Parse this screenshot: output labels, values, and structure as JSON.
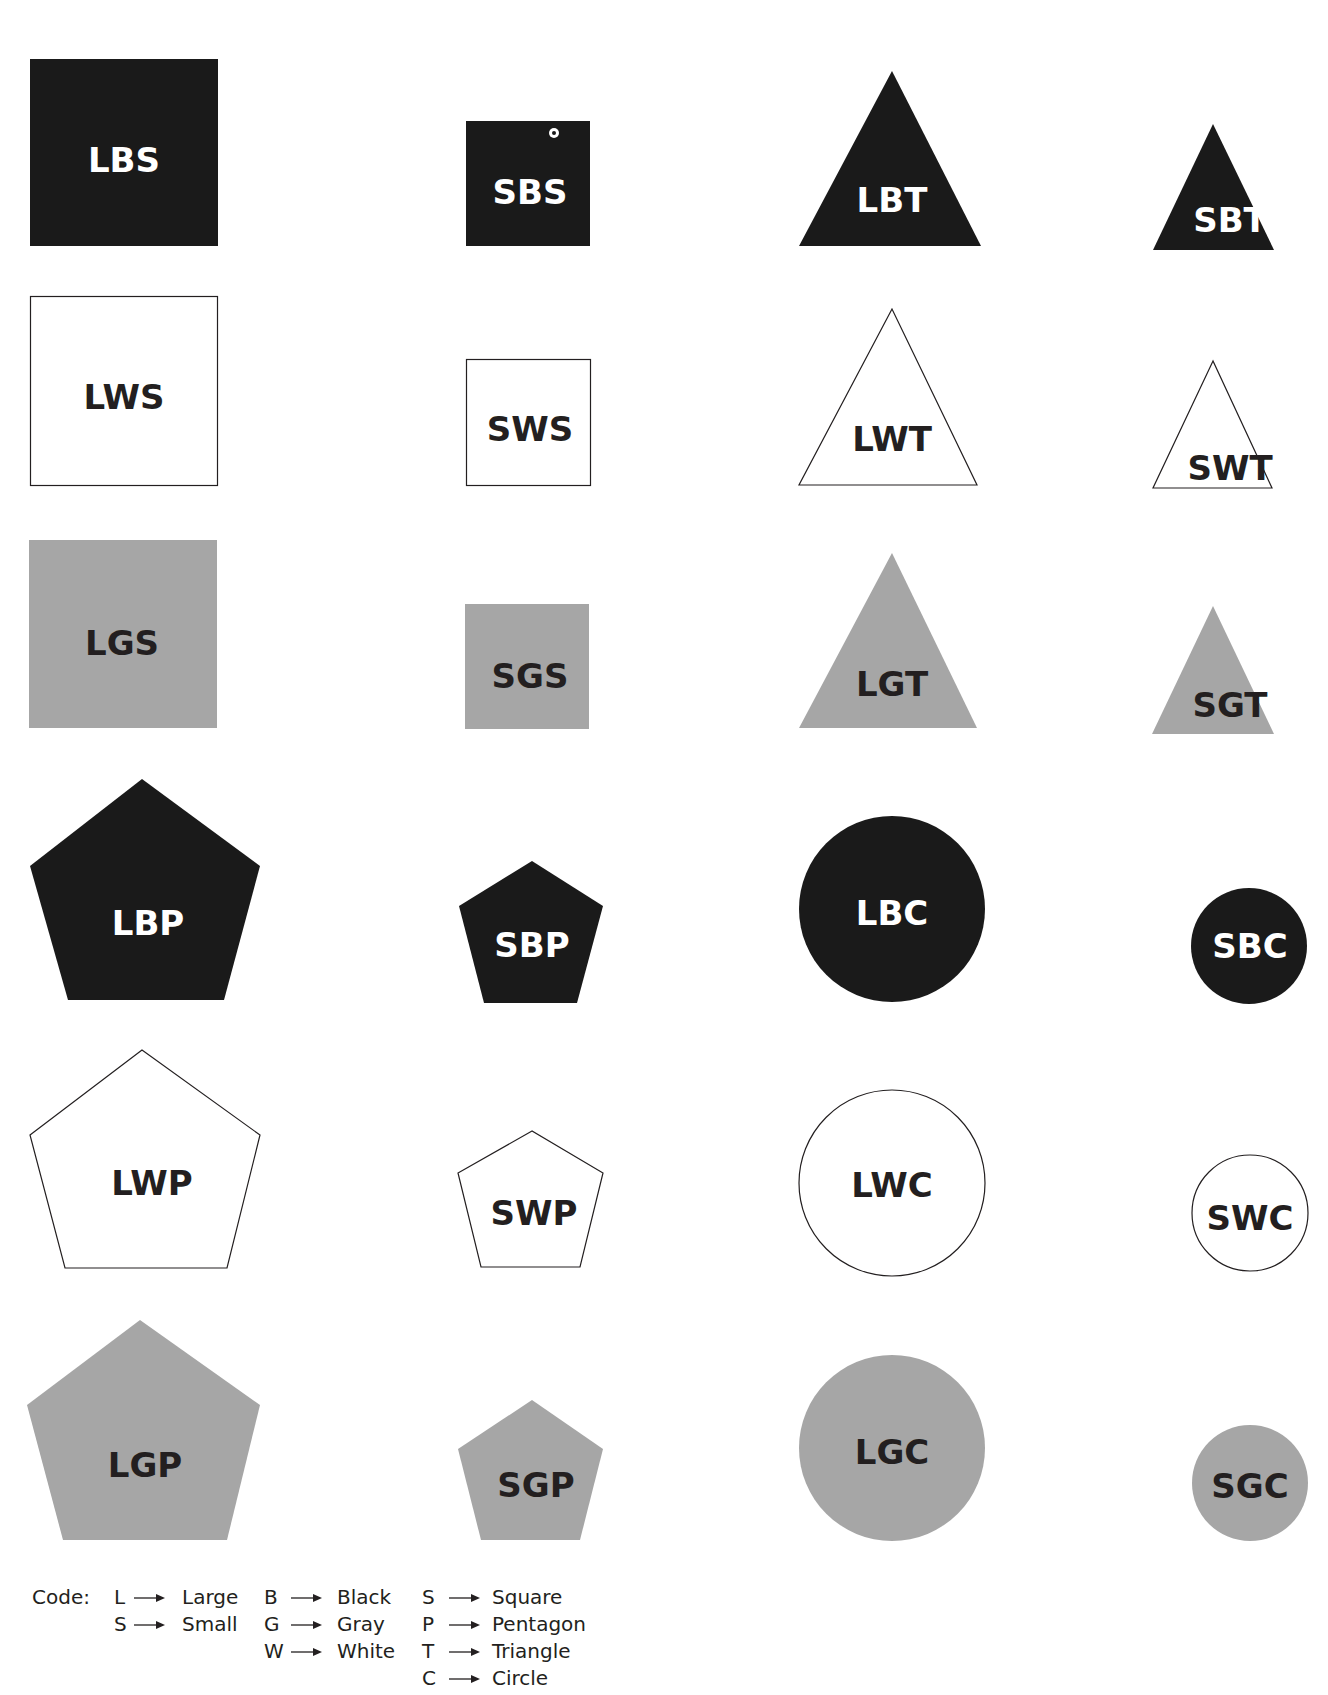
{
  "title_fragment": "",
  "colors": {
    "black": "#1a1a1a",
    "white": "#ffffff",
    "gray": "#a6a6a6",
    "stroke": "#231f20",
    "label_dark": "#231f20",
    "label_light": "#ffffff"
  },
  "shapes": [
    {
      "code": "LBS",
      "size": "Large",
      "color": "Black",
      "shape": "Square"
    },
    {
      "code": "SBS",
      "size": "Small",
      "color": "Black",
      "shape": "Square"
    },
    {
      "code": "LBT",
      "size": "Large",
      "color": "Black",
      "shape": "Triangle"
    },
    {
      "code": "SBT",
      "size": "Small",
      "color": "Black",
      "shape": "Triangle"
    },
    {
      "code": "LWS",
      "size": "Large",
      "color": "White",
      "shape": "Square"
    },
    {
      "code": "SWS",
      "size": "Small",
      "color": "White",
      "shape": "Square"
    },
    {
      "code": "LWT",
      "size": "Large",
      "color": "White",
      "shape": "Triangle"
    },
    {
      "code": "SWT",
      "size": "Small",
      "color": "White",
      "shape": "Triangle"
    },
    {
      "code": "LGS",
      "size": "Large",
      "color": "Gray",
      "shape": "Square"
    },
    {
      "code": "SGS",
      "size": "Small",
      "color": "Gray",
      "shape": "Square"
    },
    {
      "code": "LGT",
      "size": "Large",
      "color": "Gray",
      "shape": "Triangle"
    },
    {
      "code": "SGT",
      "size": "Small",
      "color": "Gray",
      "shape": "Triangle"
    },
    {
      "code": "LBP",
      "size": "Large",
      "color": "Black",
      "shape": "Pentagon"
    },
    {
      "code": "SBP",
      "size": "Small",
      "color": "Black",
      "shape": "Pentagon"
    },
    {
      "code": "LBC",
      "size": "Large",
      "color": "Black",
      "shape": "Circle"
    },
    {
      "code": "SBC",
      "size": "Small",
      "color": "Black",
      "shape": "Circle"
    },
    {
      "code": "LWP",
      "size": "Large",
      "color": "White",
      "shape": "Pentagon"
    },
    {
      "code": "SWP",
      "size": "Small",
      "color": "White",
      "shape": "Pentagon"
    },
    {
      "code": "LWC",
      "size": "Large",
      "color": "White",
      "shape": "Circle"
    },
    {
      "code": "SWC",
      "size": "Small",
      "color": "White",
      "shape": "Circle"
    },
    {
      "code": "LGP",
      "size": "Large",
      "color": "Gray",
      "shape": "Pentagon"
    },
    {
      "code": "SGP",
      "size": "Small",
      "color": "Gray",
      "shape": "Pentagon"
    },
    {
      "code": "LGC",
      "size": "Large",
      "color": "Gray",
      "shape": "Circle"
    },
    {
      "code": "SGC",
      "size": "Small",
      "color": "Gray",
      "shape": "Circle"
    }
  ],
  "legend": {
    "label": "Code:",
    "size": [
      {
        "key": "L",
        "value": "Large"
      },
      {
        "key": "S",
        "value": "Small"
      }
    ],
    "color": [
      {
        "key": "B",
        "value": "Black"
      },
      {
        "key": "G",
        "value": "Gray"
      },
      {
        "key": "W",
        "value": "White"
      }
    ],
    "shape": [
      {
        "key": "S",
        "value": "Square"
      },
      {
        "key": "P",
        "value": "Pentagon"
      },
      {
        "key": "T",
        "value": "Triangle"
      },
      {
        "key": "C",
        "value": "Circle"
      }
    ]
  }
}
